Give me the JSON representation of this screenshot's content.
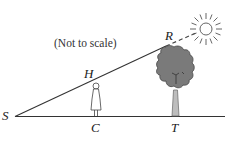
{
  "diagram": {
    "note": "(Not to scale)",
    "points": {
      "S": "S",
      "C": "C",
      "T": "T",
      "H": "H",
      "R": "R"
    },
    "elements": {
      "ground_line": "S–T ground",
      "sight_line": "S–H–R",
      "sun_ray": "R to sun (dashed)",
      "person": "person at C with head H",
      "tree": "tree at T with top R",
      "sun": "sun"
    },
    "colors": {
      "line": "#333333",
      "tree_crown": "#7a7a7a",
      "tree_trunk": "#bdbdbd",
      "sun": "#555555"
    }
  }
}
